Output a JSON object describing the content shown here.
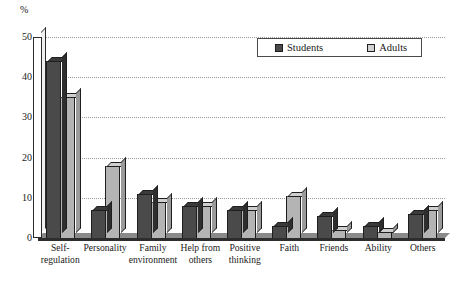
{
  "chart_data": {
    "type": "bar",
    "title": "",
    "xlabel": "",
    "ylabel": "%",
    "ylim": [
      0,
      50
    ],
    "yticks": [
      0,
      10,
      20,
      30,
      40,
      50
    ],
    "grid": true,
    "legend_position": "top-right",
    "categories": [
      "Self-\nregulation",
      "Personality",
      "Family\nenvironment",
      "Help from\nothers",
      "Positive\nthinking",
      "Faith",
      "Friends",
      "Ability",
      "Others"
    ],
    "series": [
      {
        "name": "Students",
        "color": "#4a4a4a",
        "values": [
          44,
          7,
          11,
          8,
          7,
          3,
          5.5,
          3,
          6
        ]
      },
      {
        "name": "Adults",
        "color": "#b4b4b4",
        "values": [
          35,
          18,
          9,
          8,
          7,
          10.5,
          2,
          1.5,
          7
        ]
      }
    ]
  },
  "axis": {
    "unit_label": "%",
    "tick_labels": [
      "50",
      "40",
      "30",
      "20",
      "10",
      "0"
    ]
  },
  "legend": {
    "items": [
      {
        "label": "Students"
      },
      {
        "label": "Adults"
      }
    ]
  },
  "xaxis": {
    "labels": [
      {
        "line1": "Self-",
        "line2": "regulation"
      },
      {
        "line1": "Personality",
        "line2": ""
      },
      {
        "line1": "Family",
        "line2": "environment"
      },
      {
        "line1": "Help from",
        "line2": "others"
      },
      {
        "line1": "Positive",
        "line2": "thinking"
      },
      {
        "line1": "Faith",
        "line2": ""
      },
      {
        "line1": "Friends",
        "line2": ""
      },
      {
        "line1": "Ability",
        "line2": ""
      },
      {
        "line1": "Others",
        "line2": ""
      }
    ]
  }
}
